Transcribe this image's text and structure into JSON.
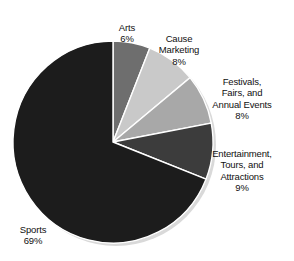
{
  "chart_data": {
    "type": "pie",
    "title": "",
    "subtitle": "",
    "xlabel": "",
    "ylabel": "",
    "legend_position": "none",
    "grid": false,
    "units": "percent",
    "start_angle_deg": 0,
    "direction": "clockwise",
    "categories": [
      "Arts",
      "Cause Marketing",
      "Festivals, Fairs, and Annual Events",
      "Entertainment, Tours, and Attractions",
      "Sports"
    ],
    "values": [
      6,
      8,
      8,
      9,
      69
    ],
    "value_labels": [
      "6%",
      "8%",
      "8%",
      "9%",
      "69%"
    ],
    "colors": [
      "#6e6e6e",
      "#c9c9c9",
      "#a8a8a8",
      "#3c3c3c",
      "#1c1c1c"
    ],
    "slices": [
      {
        "name": "Arts",
        "label_lines": [
          "Arts"
        ],
        "value": 6,
        "value_label": "6%",
        "color": "#6e6e6e"
      },
      {
        "name": "Cause Marketing",
        "label_lines": [
          "Cause",
          "Marketing"
        ],
        "value": 8,
        "value_label": "8%",
        "color": "#c9c9c9"
      },
      {
        "name": "Festivals, Fairs, and Annual Events",
        "label_lines": [
          "Festivals,",
          "Fairs, and",
          "Annual Events"
        ],
        "value": 8,
        "value_label": "8%",
        "color": "#a8a8a8"
      },
      {
        "name": "Entertainment, Tours, and Attractions",
        "label_lines": [
          "Entertainment,",
          "Tours, and",
          "Attractions"
        ],
        "value": 9,
        "value_label": "9%",
        "color": "#3c3c3c"
      },
      {
        "name": "Sports",
        "label_lines": [
          "Sports"
        ],
        "value": 69,
        "value_label": "69%",
        "color": "#1c1c1c"
      }
    ]
  },
  "labels": {
    "arts": {
      "text": "Arts",
      "percent": "6%"
    },
    "cause_marketing": {
      "text": "Cause\nMarketing",
      "percent": "8%"
    },
    "festivals": {
      "text": "Festivals,\nFairs, and\nAnnual Events",
      "percent": "8%"
    },
    "entertainment": {
      "text": "Entertainment,\nTours, and\nAttractions",
      "percent": "9%"
    },
    "sports": {
      "text": "Sports",
      "percent": "69%"
    }
  },
  "style": {
    "background": "#ffffff",
    "text_color": "#101010",
    "shadow_color": "#d9d9d9",
    "slice_border": "#ffffff"
  }
}
